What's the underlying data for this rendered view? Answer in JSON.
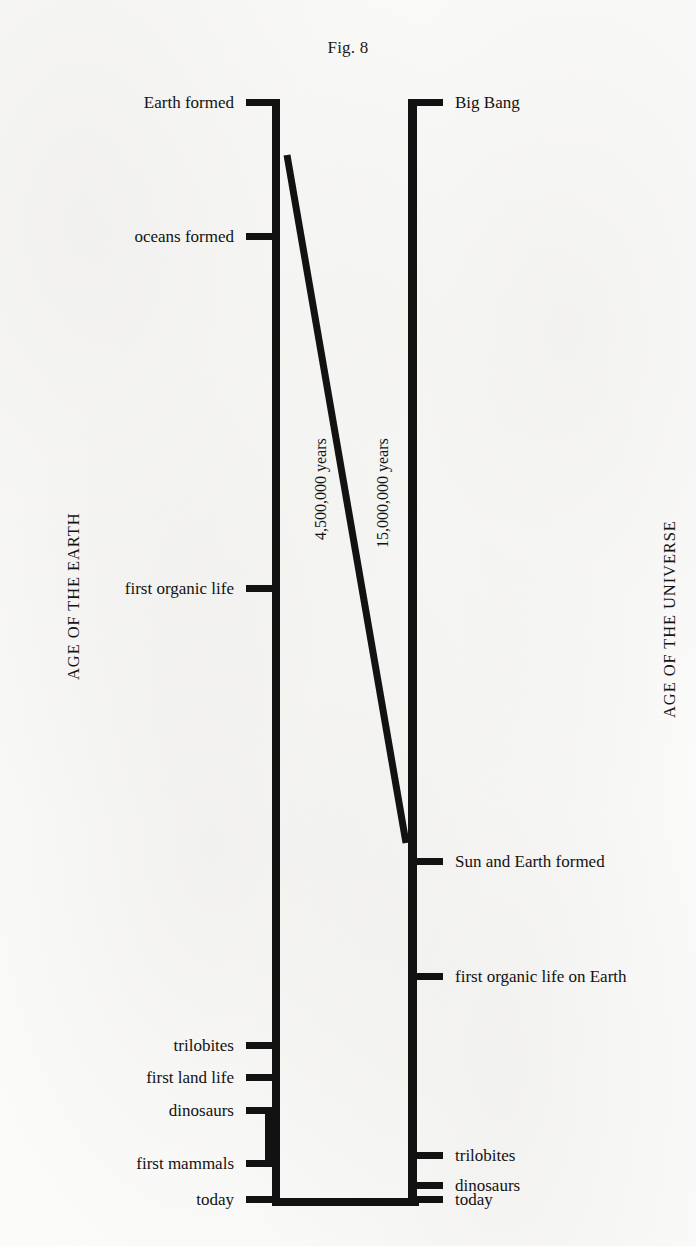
{
  "figure": {
    "title": "Fig. 8",
    "background_color": "#fbfbfa",
    "ink_color": "#121212"
  },
  "axes": {
    "left_caption": "AGE OF THE EARTH",
    "right_caption": "AGE OF THE UNIVERSE"
  },
  "spans": {
    "earth": "4,500,000 years",
    "universe": "15,000,000 years"
  },
  "chart_data": {
    "type": "timeline",
    "title": "Fig. 8",
    "orientation": "vertical",
    "direction": "top is oldest, bottom is today",
    "grid": false,
    "legend": null,
    "annotations": [
      "4,500,000 years",
      "15,000,000 years"
    ],
    "connector": "diagonal line links 'Earth formed' on the AGE OF THE EARTH scale to 'Sun and Earth formed' on the AGE OF THE UNIVERSE scale",
    "series": [
      {
        "name": "AGE OF THE EARTH",
        "span_label": "4,500,000 years",
        "side": "left",
        "events": [
          {
            "label": "Earth formed",
            "y": 102
          },
          {
            "label": "oceans formed",
            "y": 236
          },
          {
            "label": "first organic life",
            "y": 588
          },
          {
            "label": "trilobites",
            "y": 1045
          },
          {
            "label": "first land life",
            "y": 1077
          },
          {
            "label": "dinosaurs",
            "y": 1110
          },
          {
            "label": "first mammals",
            "y": 1163
          },
          {
            "label": "today",
            "y": 1199
          }
        ]
      },
      {
        "name": "AGE OF THE UNIVERSE",
        "span_label": "15,000,000 years",
        "side": "right",
        "events": [
          {
            "label": "Big Bang",
            "y": 102
          },
          {
            "label": "Sun and Earth formed",
            "y": 861
          },
          {
            "label": "first organic life on Earth",
            "y": 976
          },
          {
            "label": "trilobites",
            "y": 1155
          },
          {
            "label": "dinosaurs",
            "y": 1185
          },
          {
            "label": "today",
            "y": 1199
          }
        ]
      }
    ]
  }
}
